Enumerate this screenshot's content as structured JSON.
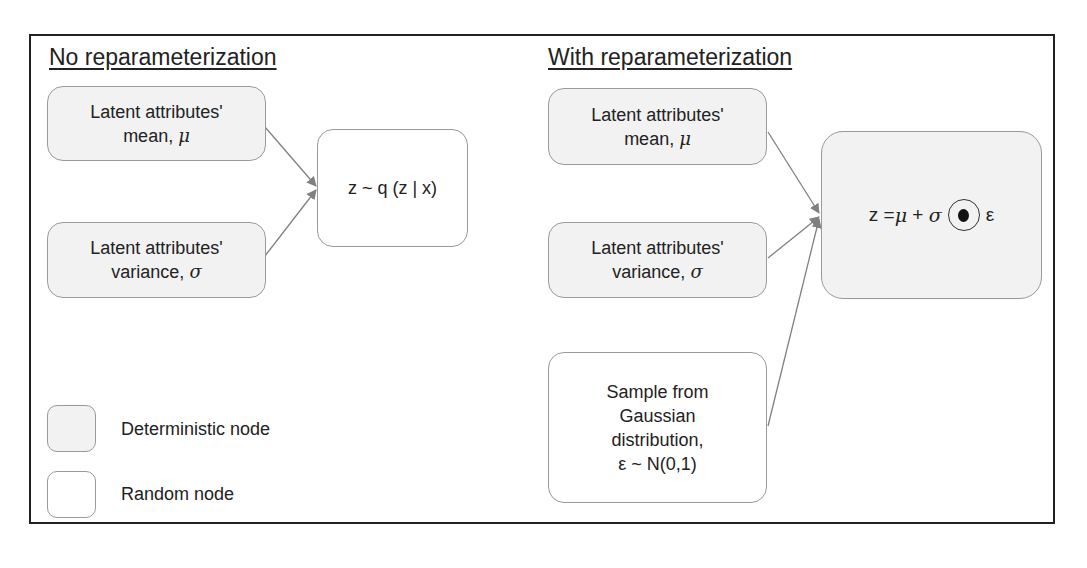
{
  "left_panel": {
    "title": "No reparameterization",
    "mean_node": {
      "line1": "Latent attributes'",
      "line2": "mean, ",
      "symbol": "μ",
      "type": "deterministic"
    },
    "variance_node": {
      "line1": "Latent attributes'",
      "line2": "variance, ",
      "symbol": "σ",
      "type": "deterministic"
    },
    "output_node": {
      "text": "z ~ q (z | x)",
      "type": "random"
    }
  },
  "right_panel": {
    "title": "With reparameterization",
    "mean_node": {
      "line1": "Latent attributes'",
      "line2": "mean, ",
      "symbol": "μ",
      "type": "deterministic"
    },
    "variance_node": {
      "line1": "Latent attributes'",
      "line2": "variance, ",
      "symbol": "σ",
      "type": "deterministic"
    },
    "sample_node": {
      "lines": [
        "Sample from",
        "Gaussian",
        "distribution,",
        "ε ~ N(0,1)"
      ],
      "type": "random"
    },
    "output_node": {
      "z": "z = ",
      "mu": "μ",
      "plus": " + ",
      "sigma": "σ",
      "epsilon": "ε",
      "operator": "hadamard-product",
      "type": "deterministic"
    }
  },
  "legend": {
    "items": [
      {
        "label": "Deterministic node",
        "type": "deterministic"
      },
      {
        "label": "Random node",
        "type": "random"
      }
    ]
  },
  "colors": {
    "deterministic_fill": "#f2f2f2",
    "random_fill": "#ffffff",
    "node_border": "#9a9a9a",
    "arrow": "#808080",
    "frame": "#222222"
  }
}
